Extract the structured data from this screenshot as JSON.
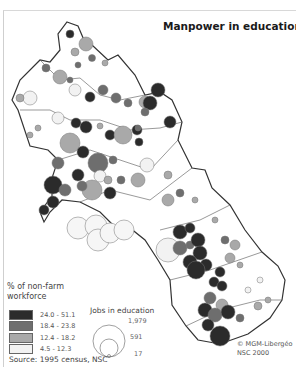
{
  "map": {
    "title": "Manpower in education",
    "legend": {
      "title_line1": "% of non-farm",
      "title_line2": "workforce",
      "classes": [
        {
          "label": "24.0 - 51.1",
          "color": "#2b2b2b"
        },
        {
          "label": "18.4 - 23.8",
          "color": "#6e6e6e"
        },
        {
          "label": "12.4 - 18.2",
          "color": "#a9a9a9"
        },
        {
          "label": "4.5 - 12.3",
          "color": "#f2f2f2"
        }
      ]
    },
    "size_legend": {
      "title": "Jobs in education",
      "values": [
        "1,979",
        "591",
        "17"
      ]
    },
    "source": "Source: 1995 census, NSC",
    "credit_line1": "© MGM-Libergéo",
    "credit_line2": "NSC 2000"
  }
}
